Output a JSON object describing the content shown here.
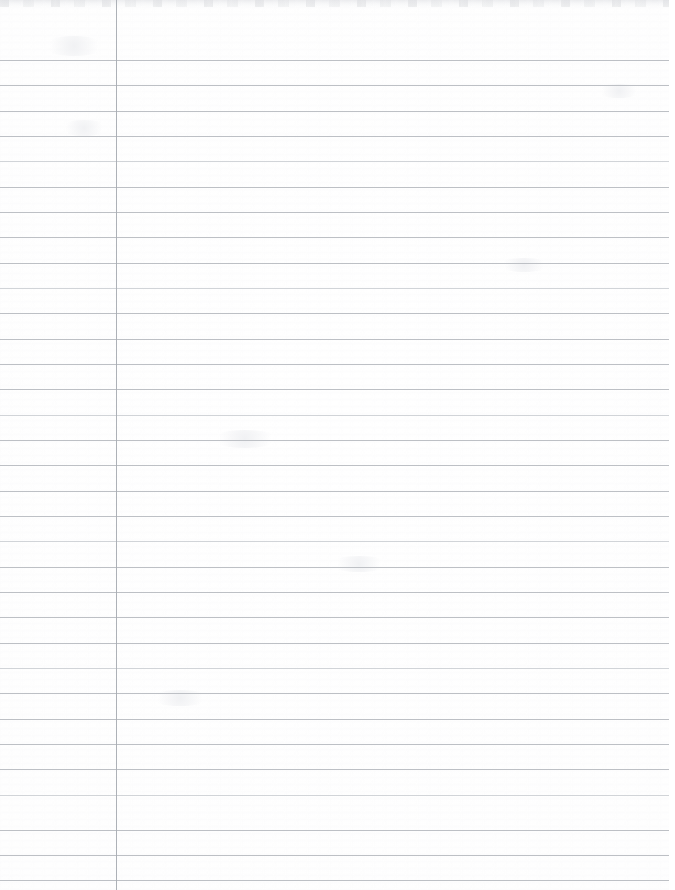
{
  "document": {
    "kind": "lined-notebook-paper",
    "title": "Blank lined notebook page",
    "description": "Scanned blank sheet of college-ruled loose-leaf notebook paper",
    "content_text": "",
    "page_width": 675,
    "page_height": 890
  },
  "colors": {
    "paper": "#ffffff",
    "paper_tint": "#fcfcfd",
    "rule_line": "#b9bdc2",
    "rule_line_faded": "#c9ccd1",
    "margin_line": "#a9adb3",
    "scan_edge": "#e4e5e8"
  },
  "ruling": {
    "first_line_y": 60,
    "line_spacing": 25.3,
    "line_count": 33,
    "line_start_x": 0,
    "line_end_x": 669,
    "margin_line_x": 116,
    "line_thickness": 1,
    "lines_y": [
      60,
      85,
      111,
      136,
      161,
      187,
      212,
      237,
      263,
      288,
      313,
      339,
      364,
      389,
      415,
      440,
      465,
      491,
      516,
      541,
      567,
      592,
      617,
      643,
      668,
      693,
      719,
      744,
      769,
      795,
      830,
      855,
      880
    ],
    "faded_line_indices": [
      4,
      9,
      14,
      19,
      24,
      29
    ]
  },
  "artifacts": {
    "top_band_height": 7,
    "smudges": [
      {
        "x": 42,
        "y": 36,
        "w": 64,
        "h": 20
      },
      {
        "x": 60,
        "y": 120,
        "w": 48,
        "h": 16
      },
      {
        "x": 210,
        "y": 430,
        "w": 70,
        "h": 18
      },
      {
        "x": 330,
        "y": 556,
        "w": 58,
        "h": 16
      },
      {
        "x": 498,
        "y": 258,
        "w": 52,
        "h": 14
      },
      {
        "x": 596,
        "y": 84,
        "w": 46,
        "h": 14
      },
      {
        "x": 150,
        "y": 690,
        "w": 60,
        "h": 16
      }
    ]
  }
}
